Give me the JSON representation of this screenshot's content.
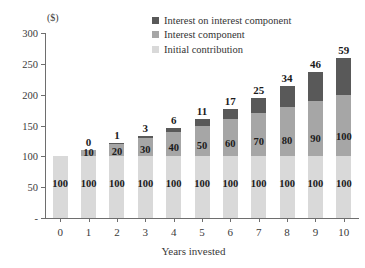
{
  "chart_data": {
    "type": "bar",
    "subtype": "stacked-bar",
    "title": "",
    "xlabel": "Years invested",
    "ylabel": "($)",
    "y_unit_label": "($)",
    "categories": [
      "0",
      "1",
      "2",
      "3",
      "4",
      "5",
      "6",
      "7",
      "8",
      "9",
      "10"
    ],
    "ylim": [
      0,
      300
    ],
    "yticks": [
      0,
      50,
      100,
      150,
      200,
      250,
      300
    ],
    "ytick_labels": [
      "-",
      "50",
      "100",
      "150",
      "200",
      "250",
      "300"
    ],
    "grid": false,
    "legend_position": "top-right",
    "series": [
      {
        "name": "Initial contribution",
        "color": "#d9d9d9",
        "values": [
          100,
          100,
          100,
          100,
          100,
          100,
          100,
          100,
          100,
          100,
          100
        ],
        "labels": [
          "100",
          "100",
          "100",
          "100",
          "100",
          "100",
          "100",
          "100",
          "100",
          "100",
          "100"
        ]
      },
      {
        "name": "Interest component",
        "color": "#a6a6a6",
        "values": [
          0,
          10,
          20,
          30,
          40,
          50,
          60,
          70,
          80,
          90,
          100
        ],
        "labels": [
          "",
          "10",
          "20",
          "30",
          "40",
          "50",
          "60",
          "70",
          "80",
          "90",
          "100"
        ]
      },
      {
        "name": "Interest on interest component",
        "color": "#595959",
        "values": [
          0,
          0,
          1,
          3,
          6,
          11,
          17,
          25,
          34,
          46,
          59
        ],
        "labels": [
          "",
          "0",
          "1",
          "3",
          "6",
          "11",
          "17",
          "25",
          "34",
          "46",
          "59"
        ]
      }
    ],
    "totals": [
      100,
      110,
      121,
      133,
      146,
      161,
      177,
      195,
      214,
      236,
      259
    ]
  },
  "legend": {
    "items": [
      {
        "label": "Interest on interest component",
        "color": "#595959"
      },
      {
        "label": "Interest component",
        "color": "#a6a6a6"
      },
      {
        "label": "Initial contribution",
        "color": "#d9d9d9"
      }
    ]
  },
  "axes": {
    "y_unit": "($)",
    "x_title": "Years invested"
  },
  "colors": {
    "dark": "#595959",
    "mid": "#a6a6a6",
    "light": "#d9d9d9",
    "axis": "#6e6e6e",
    "text": "#3a3a3a",
    "label_text": "#1b1b1b",
    "background": "#ffffff"
  }
}
